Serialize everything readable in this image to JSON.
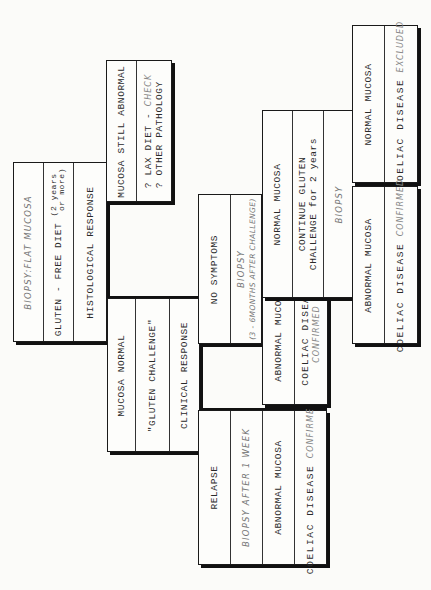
{
  "diagram": {
    "orientation": "rotated-90-ccw",
    "accent_color": "#111111",
    "nodes": {
      "root": {
        "biopsy": "BIOPSY:FLAT MUCOSA",
        "diet": "GLUTEN - FREE DIET",
        "diet_duration_1": "2 years",
        "diet_duration_2": "or more",
        "response": "HISTOLOGICAL RESPONSE"
      },
      "still_abnormal": {
        "title": "MUCOSA STILL ABNORMAL",
        "line1_prefix": "? LAX DIET - ",
        "line1_italic": "CHECK",
        "line2": "? OTHER PATHOLOGY"
      },
      "mucosa_normal": {
        "title": "MUCOSA NORMAL",
        "challenge": "\"GLUTEN CHALLENGE\"",
        "response": "CLINICAL RESPONSE"
      },
      "no_symptoms": {
        "title": "NO SYMPTOMS",
        "biopsy": "BIOPSY",
        "biopsy_timing": "(3 - 6MONTHS AFTER CHALLENGE)"
      },
      "relapse": {
        "title": "RELAPSE",
        "biopsy": "BIOPSY AFTER 1 WEEK",
        "finding": "ABNORMAL MUCOSA",
        "diagnosis": "COELIAC DISEASE",
        "diagnosis_status": "CONFIRMED"
      },
      "ns_abnormal": {
        "finding": "ABNORMAL MUCOSA",
        "diagnosis": "COELIAC DISEASE",
        "diagnosis_status": "CONFIRMED"
      },
      "ns_normal": {
        "finding": "NORMAL MUCOSA",
        "action_1": "CONTINUE GLUTEN",
        "action_2": "CHALLENGE for 2 years",
        "biopsy": "BIOPSY"
      },
      "final_normal": {
        "finding": "NORMAL MUCOSA",
        "diagnosis": "COELIAC DISEASE",
        "diagnosis_status": "EXCLUDED"
      },
      "final_abnormal": {
        "finding": "ABNORMAL MUCOSA",
        "diagnosis": "COELIAC DISEASE",
        "diagnosis_status": "CONFIRMED"
      }
    },
    "edges": [
      [
        "root",
        "still_abnormal"
      ],
      [
        "root",
        "mucosa_normal"
      ],
      [
        "mucosa_normal",
        "no_symptoms"
      ],
      [
        "mucosa_normal",
        "relapse"
      ],
      [
        "no_symptoms",
        "ns_abnormal"
      ],
      [
        "no_symptoms",
        "ns_normal"
      ],
      [
        "ns_normal",
        "final_normal"
      ],
      [
        "ns_normal",
        "final_abnormal"
      ]
    ]
  }
}
